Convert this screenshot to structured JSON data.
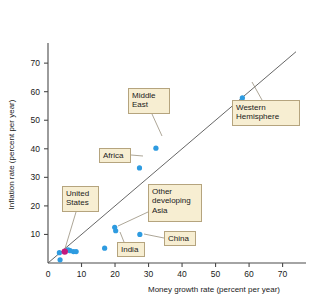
{
  "chart_data": {
    "type": "scatter",
    "title": "",
    "xlabel": "Money growth rate (percent per year)",
    "ylabel": "Inflation rate (percent per year)",
    "xlim": [
      0,
      74
    ],
    "ylim": [
      0,
      76
    ],
    "xticks": [
      0,
      10,
      20,
      30,
      40,
      50,
      60,
      70
    ],
    "yticks": [
      0,
      10,
      20,
      30,
      40,
      50,
      60,
      70
    ],
    "grid": false,
    "legend": "none",
    "reference_line": {
      "name": "45-degree-line",
      "description": "45 degree line where inflation rate equals money growth rate",
      "from": [
        0,
        0
      ],
      "to": [
        74,
        74
      ]
    },
    "points": [
      {
        "label": "Western Hemisphere",
        "x": 58.0,
        "y": 57.8,
        "color": "#2e9be0"
      },
      {
        "label": "Middle East",
        "x": 32.2,
        "y": 40.2,
        "color": "#2e9be0"
      },
      {
        "label": "Africa",
        "x": 27.3,
        "y": 33.3,
        "color": "#2e9be0"
      },
      {
        "label": "Other developing Asia",
        "x": 19.9,
        "y": 12.5,
        "color": "#2e9be0"
      },
      {
        "label": "Other developing Asia",
        "x": 20.2,
        "y": 11.3,
        "color": "#2e9be0"
      },
      {
        "label": "China",
        "x": 27.4,
        "y": 10.0,
        "color": "#2e9be0"
      },
      {
        "label": "India",
        "x": 16.9,
        "y": 5.2,
        "color": "#2e9be0"
      },
      {
        "label": "",
        "x": 7.6,
        "y": 4.0,
        "color": "#2e9be0"
      },
      {
        "label": "",
        "x": 8.4,
        "y": 4.0,
        "color": "#2e9be0"
      },
      {
        "label": "",
        "x": 6.6,
        "y": 4.3,
        "color": "#2e9be0"
      },
      {
        "label": "",
        "x": 6.0,
        "y": 4.6,
        "color": "#2e9be0"
      },
      {
        "label": "",
        "x": 3.4,
        "y": 3.6,
        "color": "#2e9be0"
      },
      {
        "label": "",
        "x": 3.6,
        "y": 1.1,
        "color": "#2e9be0"
      },
      {
        "label": "United States",
        "x": 5.0,
        "y": 4.0,
        "color": "#c3197d"
      }
    ],
    "callouts": [
      {
        "name": "middle-east",
        "text": "Middle\nEast",
        "box": {
          "left": 128,
          "top": 88,
          "width": 42,
          "height": 26
        },
        "leader": {
          "x1": 152,
          "y1": 114,
          "x2": 162,
          "y2": 136
        }
      },
      {
        "name": "western-hemisphere",
        "text": "Western\nHemisphere",
        "box": {
          "left": 232,
          "top": 100,
          "width": 68,
          "height": 26
        },
        "leader": {
          "x1": 262,
          "y1": 100,
          "x2": 252,
          "y2": 82
        }
      },
      {
        "name": "africa",
        "text": "Africa",
        "box": {
          "left": 99,
          "top": 148,
          "width": 32,
          "height": 14
        },
        "leader": {
          "x1": 131,
          "y1": 155,
          "x2": 143,
          "y2": 156
        }
      },
      {
        "name": "united-states",
        "text": "United\nStates",
        "box": {
          "left": 62,
          "top": 186,
          "width": 37,
          "height": 26
        },
        "leader": {
          "x1": 76,
          "y1": 212,
          "x2": 64,
          "y2": 252
        }
      },
      {
        "name": "other-developing-asia",
        "text": "Other\ndeveloping\nAsia",
        "box": {
          "left": 148,
          "top": 184,
          "width": 54,
          "height": 38
        },
        "leader": {
          "x1": 148,
          "y1": 212,
          "x2": 118,
          "y2": 226
        }
      },
      {
        "name": "china",
        "text": "China",
        "box": {
          "left": 164,
          "top": 231,
          "width": 32,
          "height": 14
        },
        "leader": {
          "x1": 164,
          "y1": 238,
          "x2": 144,
          "y2": 234
        }
      },
      {
        "name": "india",
        "text": "India",
        "box": {
          "left": 117,
          "top": 242,
          "width": 28,
          "height": 14
        },
        "leader": {
          "x1": 124,
          "y1": 242,
          "x2": 120,
          "y2": 232
        }
      }
    ]
  },
  "axes": {
    "x_title": "Money growth rate (percent per year)",
    "y_title": "Inflation rate (percent per year)",
    "x_tick_labels": [
      "0",
      "10",
      "20",
      "30",
      "40",
      "50",
      "60",
      "70"
    ],
    "y_tick_labels": [
      "0",
      "10",
      "20",
      "30",
      "40",
      "50",
      "60",
      "70"
    ]
  },
  "colors": {
    "point": "#2e9be0",
    "point_us": "#c3197d",
    "callout_fill": "#f7eed2",
    "callout_border": "#b5a47e",
    "axis": "#4a4a4a",
    "diagonal": "#555555"
  }
}
